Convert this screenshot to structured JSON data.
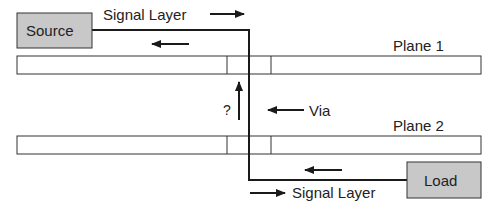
{
  "diagram": {
    "source_label": "Source",
    "load_label": "Load",
    "signal_layer_top": "Signal Layer",
    "signal_layer_bottom": "Signal Layer",
    "plane1_label": "Plane 1",
    "plane2_label": "Plane 2",
    "via_label": "Via",
    "question_mark": "?"
  },
  "colors": {
    "box_fill": "#c8c8c8",
    "line": "#1a1a1a",
    "background": "#ffffff"
  }
}
